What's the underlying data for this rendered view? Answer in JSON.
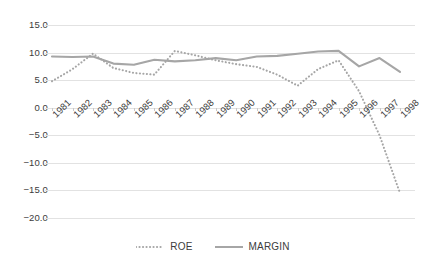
{
  "chart_data": {
    "type": "line",
    "title": "",
    "xlabel": "",
    "ylabel": "",
    "categories": [
      "1981",
      "1982",
      "1983",
      "1984",
      "1985",
      "1986",
      "1987",
      "1988",
      "1989",
      "1990",
      "1991",
      "1992",
      "1993",
      "1994",
      "1995",
      "1996",
      "1997",
      "1998"
    ],
    "series": [
      {
        "name": "ROE",
        "style": "dotted",
        "color": "#a6a6a6",
        "values": [
          4.8,
          7.0,
          9.8,
          7.2,
          6.3,
          6.0,
          10.3,
          9.5,
          8.6,
          7.9,
          7.4,
          6.0,
          4.0,
          7.0,
          8.6,
          3.0,
          -5.0,
          -15.5
        ]
      },
      {
        "name": "MARGIN",
        "style": "solid",
        "color": "#a6a6a6",
        "values": [
          9.3,
          9.2,
          9.3,
          8.0,
          7.8,
          8.7,
          8.4,
          8.6,
          9.0,
          8.6,
          9.3,
          9.4,
          9.8,
          10.2,
          10.3,
          7.5,
          9.0,
          6.5
        ]
      }
    ],
    "ylim": [
      -20.0,
      15.0
    ],
    "yticks": [
      "15.0",
      "10.0",
      "5.0",
      "0.0",
      "-5.0",
      "-10.0",
      "-15.0",
      "-20.0"
    ],
    "ytick_values": [
      15.0,
      10.0,
      5.0,
      0.0,
      -5.0,
      -10.0,
      -15.0,
      -20.0
    ],
    "grid": true,
    "legend_position": "bottom"
  },
  "legend": {
    "items": [
      {
        "label": "ROE"
      },
      {
        "label": "MARGIN"
      }
    ]
  }
}
